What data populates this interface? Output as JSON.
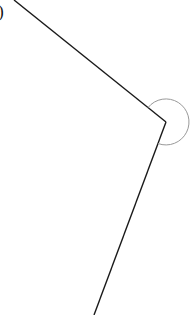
{
  "diagram": {
    "type": "angle",
    "label_partial": ")",
    "vertex": {
      "x": 166,
      "y": 122
    },
    "ray1_end": {
      "x": 14,
      "y": 0
    },
    "ray2_end": {
      "x": 94,
      "y": 315
    },
    "arc": {
      "radius": 23,
      "stroke": "#999999"
    },
    "line_color": "#1a1a1a"
  }
}
